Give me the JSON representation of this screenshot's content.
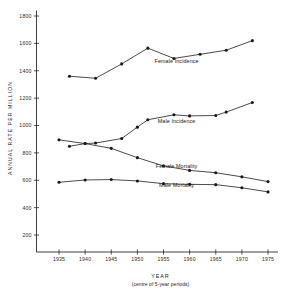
{
  "chart_data": {
    "type": "line",
    "title": "",
    "xlabel": "YEAR",
    "xlabel_sub": "(centre of 5-year periods)",
    "ylabel": "ANNUAL RATE PER MILLION",
    "xlim": [
      1932,
      1977
    ],
    "ylim": [
      100,
      1870
    ],
    "grid": false,
    "legend_position": "inline-annotation",
    "xticks": [
      1935,
      1940,
      1945,
      1950,
      1955,
      1960,
      1965,
      1970,
      1975
    ],
    "xtick_labels": [
      "1935",
      "1940",
      "1945",
      "1950",
      "1955",
      "1960",
      "1965",
      "1970",
      "1975"
    ],
    "yticks": [
      200,
      400,
      600,
      800,
      1000,
      1200,
      1400,
      1600,
      1800
    ],
    "ytick_labels": [
      "200",
      "400",
      "600",
      "800",
      "1000",
      "1200",
      "1400",
      "1600",
      "1800"
    ],
    "series": [
      {
        "name": "Female Incidence",
        "label": "Female Incidence",
        "label_x": 1957.5,
        "label_y": 1455,
        "x": [
          1937,
          1942,
          1947,
          1952,
          1957,
          1962,
          1967,
          1972
        ],
        "values": [
          1360,
          1345,
          1450,
          1565,
          1490,
          1520,
          1550,
          1620
        ]
      },
      {
        "name": "Male Incidence",
        "label": "Male Incidence",
        "label_x": 1957.5,
        "label_y": 1020,
        "x": [
          1937,
          1940,
          1942,
          1947,
          1950,
          1952,
          1957,
          1960,
          1965,
          1967,
          1972
        ],
        "values": [
          848,
          868,
          872,
          905,
          988,
          1042,
          1078,
          1070,
          1073,
          1098,
          1168
        ]
      },
      {
        "name": "Female Mortality",
        "label": "Female Mortality",
        "label_x": 1957.5,
        "label_y": 690,
        "x": [
          1935,
          1940,
          1945,
          1950,
          1955,
          1960,
          1965,
          1970,
          1975
        ],
        "values": [
          895,
          868,
          833,
          765,
          705,
          672,
          655,
          625,
          590
        ]
      },
      {
        "name": "Male Mortality",
        "label": "Male Mortality",
        "label_x": 1957.5,
        "label_y": 553,
        "x": [
          1935,
          1940,
          1945,
          1950,
          1955,
          1960,
          1965,
          1970,
          1975
        ],
        "values": [
          585,
          602,
          605,
          595,
          575,
          570,
          568,
          545,
          515
        ]
      }
    ]
  },
  "colors": {
    "ink": "#1a1a1a",
    "axis": "#2b2b2b",
    "background": "#ffffff"
  }
}
